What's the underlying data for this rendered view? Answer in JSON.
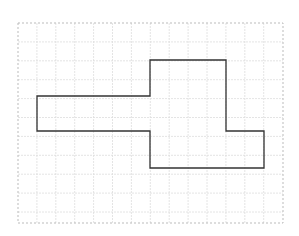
{
  "diagram": {
    "type": "grid-polygon",
    "grid": {
      "left": 18,
      "top": 23,
      "right": 283,
      "bottom": 223,
      "cell": 18.9,
      "line_color": "#dddddd",
      "border_color": "#bbbbbb"
    },
    "shape": {
      "stroke": "#333333",
      "stroke_width": 1.3,
      "fill": "none",
      "points": "37,96 150,96 150,60 226,60 226,131 264,131 264,168 150,168 150,131 37,131"
    }
  }
}
